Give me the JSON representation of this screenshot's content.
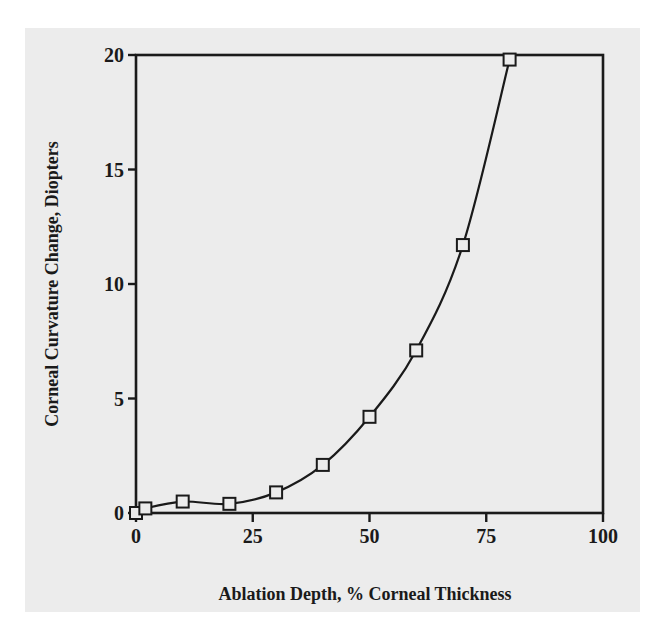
{
  "chart_data": {
    "type": "line",
    "title": "",
    "xlabel": "Ablation Depth, % Corneal Thickness",
    "ylabel": "Corneal Curvature Change, Diopters",
    "xlim": [
      0,
      100
    ],
    "ylim": [
      0,
      20
    ],
    "x_ticks": [
      0,
      25,
      50,
      75,
      100
    ],
    "y_ticks": [
      0,
      5,
      10,
      15,
      20
    ],
    "grid": false,
    "legend": null,
    "marker": "open-square",
    "line_style": "smooth-curve",
    "series": [
      {
        "name": "Corneal Curvature Change",
        "x": [
          0,
          2,
          10,
          20,
          30,
          40,
          50,
          60,
          70,
          80
        ],
        "y": [
          0,
          0.2,
          0.5,
          0.4,
          0.9,
          2.1,
          4.2,
          7.1,
          11.7,
          19.8
        ]
      }
    ]
  },
  "axes": {
    "x_tick_labels": [
      "0",
      "25",
      "50",
      "75",
      "100"
    ],
    "y_tick_labels": [
      "0",
      "5",
      "10",
      "15",
      "20"
    ],
    "x_title": "Ablation Depth, % Corneal Thickness",
    "y_title": "Corneal Curvature Change, Diopters"
  },
  "colors": {
    "ink": "#1a1a1a",
    "paper": "#ececec",
    "background": "#ffffff"
  }
}
